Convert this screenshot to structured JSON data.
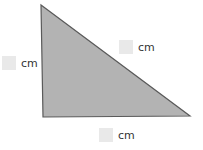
{
  "triangle": {
    "fill": "#b3b3b3",
    "stroke": "#5a5a5a",
    "vertices": {
      "top": [
        41,
        5
      ],
      "bottom_left": [
        43,
        117
      ],
      "bottom_right": [
        190,
        116
      ]
    }
  },
  "labels": {
    "left": {
      "value": "",
      "unit": "cm"
    },
    "hypotenuse": {
      "value": "",
      "unit": "cm"
    },
    "bottom": {
      "value": "",
      "unit": "cm"
    }
  }
}
